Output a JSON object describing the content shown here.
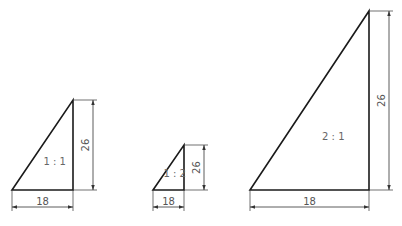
{
  "figures": [
    {
      "id": "scale-1-1",
      "scale_label": "1:1",
      "width_label": "18",
      "height_label": "26",
      "bl": [
        12,
        190
      ],
      "br": [
        73,
        190
      ],
      "top": [
        73,
        100
      ],
      "vdim_x": 93,
      "hdim_y": 207
    },
    {
      "id": "scale-1-2",
      "scale_label": "1:2",
      "width_label": "18",
      "height_label": "26",
      "bl": [
        153,
        190
      ],
      "br": [
        184,
        190
      ],
      "top": [
        184,
        145
      ],
      "vdim_x": 204,
      "hdim_y": 207
    },
    {
      "id": "scale-2-1",
      "scale_label": "2:1",
      "width_label": "18",
      "height_label": "26",
      "bl": [
        250,
        190
      ],
      "br": [
        369,
        190
      ],
      "top": [
        369,
        11
      ],
      "vdim_x": 389,
      "hdim_y": 207
    }
  ],
  "colors": {
    "line": "#1a1a1a",
    "dimension": "#333333",
    "text": "#555555"
  }
}
